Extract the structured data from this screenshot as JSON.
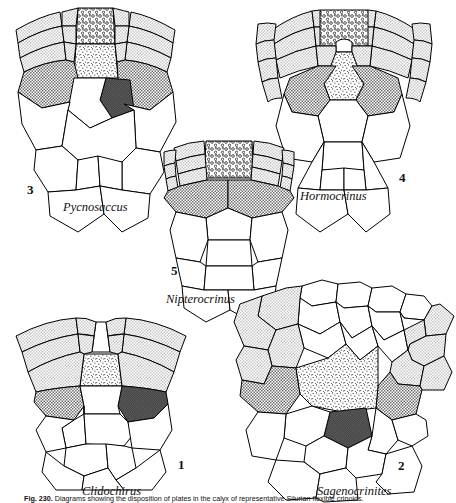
{
  "figure": {
    "caption_prefix": "Fig. 230.",
    "caption_text": "Diagrams showing the disposition of plates in the calyx of representative Silurian flexible crinoids.",
    "panels": [
      {
        "id": "1",
        "number": "1",
        "genus": "Clidochirus",
        "number_x": 178,
        "number_y": 466,
        "genus_x": 82,
        "genus_y": 492
      },
      {
        "id": "2",
        "number": "2",
        "genus": "Sagenocrinites",
        "number_x": 398,
        "number_y": 467,
        "genus_x": 317,
        "genus_y": 492
      },
      {
        "id": "3",
        "number": "3",
        "genus": "Pycnosaccus",
        "number_x": 27,
        "number_y": 191,
        "genus_x": 63,
        "genus_y": 207
      },
      {
        "id": "4",
        "number": "4",
        "genus": "Hormocrinus",
        "number_x": 399,
        "number_y": 179,
        "genus_x": 300,
        "genus_y": 197
      },
      {
        "id": "5",
        "number": "5",
        "genus": "Nipterocrinus",
        "number_x": 171,
        "number_y": 272,
        "genus_x": 166,
        "genus_y": 300
      }
    ]
  },
  "legend": {
    "plate_fills": [
      {
        "name": "white-plate",
        "role": "radial / brachial plates",
        "color": "#ffffff"
      },
      {
        "name": "light-stipple-plate",
        "role": "arm and interbrachial plates",
        "color": "#e3e3e3"
      },
      {
        "name": "medium-gray-plate",
        "role": "basal plates",
        "color": "#8e8e8e"
      },
      {
        "name": "dark-gray-plate",
        "role": "anal / radianal plate",
        "color": "#4a4a4a"
      },
      {
        "name": "fine-stipple-plate",
        "role": "anal sac plate",
        "color": "#efefef"
      },
      {
        "name": "circles-plate",
        "role": "tegmen / anal sac",
        "color": "#ffffff"
      }
    ],
    "outline_color": "#000000"
  }
}
